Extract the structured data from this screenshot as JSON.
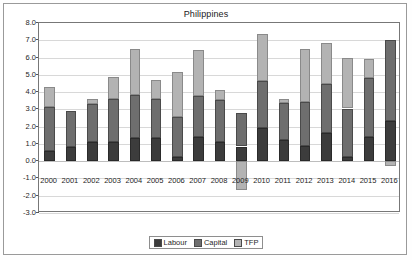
{
  "chart_data": {
    "type": "bar",
    "stacked": true,
    "title": "Philippines",
    "xlabel": "",
    "ylabel": "",
    "ylim": [
      -3.0,
      8.0
    ],
    "ytick_step": 1.0,
    "ytick_labels": [
      "8.0",
      "7.0",
      "6.0",
      "5.0",
      "4.0",
      "3.0",
      "2.0",
      "1.0",
      "0.0",
      "-1.0",
      "-2.0",
      "-3.0"
    ],
    "ytick_values": [
      8.0,
      7.0,
      6.0,
      5.0,
      4.0,
      3.0,
      2.0,
      1.0,
      0.0,
      -1.0,
      -2.0,
      -3.0
    ],
    "grid": true,
    "legend_position": "bottom",
    "categories": [
      "2000",
      "2001",
      "2002",
      "2003",
      "2004",
      "2005",
      "2006",
      "2007",
      "2008",
      "2009",
      "2010",
      "2011",
      "2012",
      "2013",
      "2014",
      "2015",
      "2016"
    ],
    "series": [
      {
        "name": "Labour",
        "color": "#3c3c3c",
        "values": [
          0.6,
          0.8,
          1.1,
          1.1,
          1.35,
          1.35,
          0.25,
          1.4,
          1.1,
          0.85,
          1.9,
          1.2,
          0.9,
          1.65,
          0.25,
          1.4,
          2.3
        ]
      },
      {
        "name": "Capital",
        "color": "#6e6e6e",
        "values": [
          2.55,
          2.1,
          2.2,
          2.5,
          2.5,
          2.25,
          2.3,
          2.35,
          2.45,
          1.95,
          2.75,
          2.15,
          2.5,
          2.8,
          2.8,
          3.4,
          4.7
        ]
      },
      {
        "name": "TFP",
        "color": "#b3b3b3",
        "values": [
          1.15,
          0.0,
          0.3,
          1.25,
          2.65,
          1.1,
          2.6,
          2.7,
          0.55,
          -1.65,
          2.7,
          0.25,
          3.1,
          2.4,
          2.95,
          1.1,
          -0.3
        ]
      }
    ],
    "totals": [
      4.3,
      2.9,
      3.6,
      4.85,
      6.5,
      4.7,
      5.15,
      6.45,
      4.1,
      1.15,
      7.35,
      3.6,
      6.5,
      6.85,
      6.0,
      5.9,
      6.7
    ]
  },
  "legend": {
    "items": [
      {
        "label": "Labour",
        "swatch": "labour-swatch"
      },
      {
        "label": "Capital",
        "swatch": "capital-swatch"
      },
      {
        "label": "TFP",
        "swatch": "tfp-swatch"
      }
    ]
  },
  "colors": {
    "labour": "#3c3c3c",
    "capital": "#6e6e6e",
    "tfp": "#b3b3b3",
    "grid": "#d8d8d8",
    "axis": "#777777",
    "frame": "#9a9a9a"
  }
}
